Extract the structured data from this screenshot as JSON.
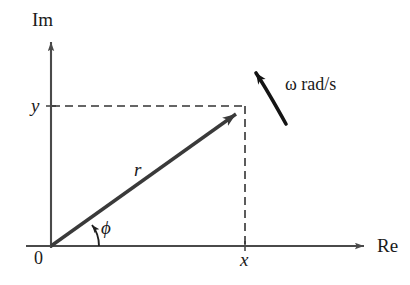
{
  "figure": {
    "type": "phasor-diagram",
    "background_color": "#ffffff",
    "stroke_color": "#2b2b2b",
    "vector_color": "#3a3a3a",
    "axis_color": "#4a4a4a"
  },
  "axes": {
    "imaginary": {
      "label": "Im",
      "direction": "up",
      "x_px": 51,
      "from_y_px": 246,
      "to_y_px": 37
    },
    "real": {
      "label": "Re",
      "direction": "right",
      "y_px": 246,
      "from_x_px": 26,
      "to_x_px": 371
    },
    "origin_label": "0"
  },
  "vector": {
    "magnitude_label": "r",
    "angle_label": "ϕ",
    "tip_x_px": 244,
    "tip_y_px": 108,
    "tail_x_px": 51,
    "tail_y_px": 246
  },
  "projections": {
    "imaginary_component_label": "y",
    "imaginary_component_y_px": 106,
    "real_component_label": "x",
    "real_component_x_px": 245,
    "line_style": "dashed"
  },
  "rotation": {
    "symbol": "ω",
    "units": "rad/s",
    "full_label": "ω rad/s",
    "direction": "counterclockwise"
  }
}
